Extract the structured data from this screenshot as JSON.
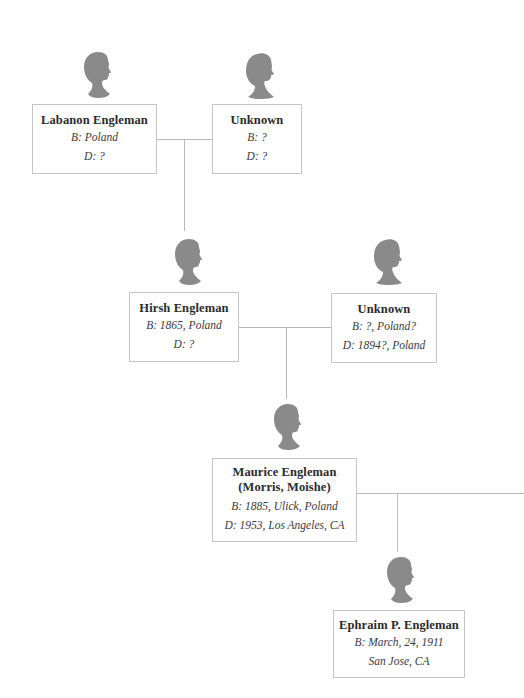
{
  "tree": {
    "style": {
      "line_color": "#b9b9b9",
      "box_border_color": "#c4c4c4",
      "silhouette_color": "#8a8a8a"
    },
    "generation1": {
      "father": {
        "name": "Labanon Engleman",
        "birth": "B: Poland",
        "death": "D: ?",
        "silhouette": "male-silhouette-icon"
      },
      "mother": {
        "name": "Unknown",
        "birth": "B: ?",
        "death": "D: ?",
        "silhouette": "female-silhouette-icon"
      }
    },
    "generation2": {
      "father": {
        "name": "Hirsh Engleman",
        "birth": "B: 1865, Poland",
        "death": "D: ?",
        "silhouette": "male-silhouette-icon"
      },
      "mother": {
        "name": "Unknown",
        "birth": "B: ?, Poland?",
        "death": "D: 1894?, Poland",
        "silhouette": "female-silhouette-icon"
      }
    },
    "generation3": {
      "person": {
        "name": "Maurice Engleman",
        "aka": "(Morris, Moishe)",
        "birth": "B: 1885, Ulick, Poland",
        "death": "D: 1953, Los Angeles, CA",
        "silhouette": "male-silhouette-icon"
      }
    },
    "generation4": {
      "person": {
        "name": "Ephraim P. Engleman",
        "birth": "B: March, 24, 1911",
        "birthplace": "San Jose, CA",
        "silhouette": "male-silhouette-icon"
      }
    }
  }
}
